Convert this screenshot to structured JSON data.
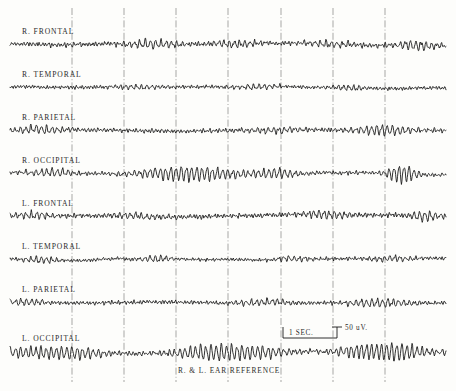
{
  "figure": {
    "caption": "R. & L. EAR REFERENCE",
    "background_color": "#fdfdfb",
    "trace_color": "#1a1a1a",
    "grid_color": "#5a5a5a"
  },
  "calibration": {
    "time_label": "1 SEC.",
    "amplitude_label": "50 uV.",
    "time_seconds": 1,
    "amplitude_microvolts": 50,
    "bar_x_start_px": 283,
    "bar_x_end_px": 337,
    "bar_y_px": 338,
    "tick_height_px": 11
  },
  "chart_data": {
    "type": "line",
    "title": "",
    "subtitle": "",
    "xlabel": "1 SEC.",
    "ylabel": "50 uV.",
    "legend_position": "none",
    "grid": true,
    "grid_x_positions_px": [
      72,
      124,
      176,
      228,
      281,
      333,
      385
    ],
    "x_axis": {
      "units": "seconds",
      "plot_x_start_px": 10,
      "plot_x_end_px": 446,
      "seconds_per_division": 1
    },
    "y_axis": {
      "units": "microvolts",
      "calibration_microvolts": 50
    },
    "annotations": [
      "R. & L. EAR REFERENCE",
      "1 SEC.",
      "50 uV."
    ],
    "series": [
      {
        "name": "R. FRONTAL",
        "label": "R. FRONTAL",
        "baseline_y_px": 44,
        "label_y_px": 27,
        "band": "beta-mixed",
        "base_amplitude": 2.6,
        "base_frequency": 17.5,
        "seed": 11,
        "bursts": [
          {
            "center_fraction": 0.32,
            "width_fraction": 0.1,
            "amplitude": 3.0,
            "frequency": 10.2
          },
          {
            "center_fraction": 0.52,
            "width_fraction": 0.09,
            "amplitude": 3.4,
            "frequency": 10.6
          },
          {
            "center_fraction": 0.74,
            "width_fraction": 0.07,
            "amplitude": 3.2,
            "frequency": 10.0
          },
          {
            "center_fraction": 0.93,
            "width_fraction": 0.06,
            "amplitude": 3.6,
            "frequency": 10.4
          }
        ]
      },
      {
        "name": "R. TEMPORAL",
        "label": "R. TEMPORAL",
        "baseline_y_px": 87,
        "label_y_px": 70,
        "band": "low-voltage-fast",
        "base_amplitude": 1.9,
        "base_frequency": 18.5,
        "seed": 23,
        "bursts": [
          {
            "center_fraction": 0.3,
            "width_fraction": 0.08,
            "amplitude": 2.0,
            "frequency": 10.5
          },
          {
            "center_fraction": 0.56,
            "width_fraction": 0.07,
            "amplitude": 2.2,
            "frequency": 10.2
          },
          {
            "center_fraction": 0.78,
            "width_fraction": 0.06,
            "amplitude": 2.4,
            "frequency": 10.6
          }
        ]
      },
      {
        "name": "R. PARIETAL",
        "label": "R. PARIETAL",
        "baseline_y_px": 130,
        "label_y_px": 113,
        "band": "alpha-mixed",
        "base_amplitude": 2.3,
        "base_frequency": 17.0,
        "seed": 37,
        "bursts": [
          {
            "center_fraction": 0.07,
            "width_fraction": 0.08,
            "amplitude": 3.0,
            "frequency": 10.4
          },
          {
            "center_fraction": 0.62,
            "width_fraction": 0.1,
            "amplitude": 2.6,
            "frequency": 10.2
          },
          {
            "center_fraction": 0.86,
            "width_fraction": 0.09,
            "amplitude": 4.2,
            "frequency": 10.5
          }
        ]
      },
      {
        "name": "R. OCCIPITAL",
        "label": "R. OCCIPITAL",
        "baseline_y_px": 173,
        "label_y_px": 156,
        "band": "alpha-dominant",
        "base_amplitude": 2.1,
        "base_frequency": 16.5,
        "seed": 53,
        "bursts": [
          {
            "center_fraction": 0.1,
            "width_fraction": 0.07,
            "amplitude": 3.2,
            "frequency": 10.3
          },
          {
            "center_fraction": 0.42,
            "width_fraction": 0.16,
            "amplitude": 6.8,
            "frequency": 10.5
          },
          {
            "center_fraction": 0.61,
            "width_fraction": 0.07,
            "amplitude": 3.6,
            "frequency": 10.2
          },
          {
            "center_fraction": 0.9,
            "width_fraction": 0.05,
            "amplitude": 7.5,
            "frequency": 11.0
          }
        ]
      },
      {
        "name": "L. FRONTAL",
        "label": "L. FRONTAL",
        "baseline_y_px": 216,
        "label_y_px": 199,
        "band": "beta-mixed",
        "base_amplitude": 2.5,
        "base_frequency": 17.8,
        "seed": 71,
        "bursts": [
          {
            "center_fraction": 0.05,
            "width_fraction": 0.07,
            "amplitude": 3.4,
            "frequency": 10.4
          },
          {
            "center_fraction": 0.3,
            "width_fraction": 0.08,
            "amplitude": 2.8,
            "frequency": 10.1
          },
          {
            "center_fraction": 0.72,
            "width_fraction": 0.08,
            "amplitude": 3.0,
            "frequency": 10.6
          },
          {
            "center_fraction": 0.95,
            "width_fraction": 0.05,
            "amplitude": 3.8,
            "frequency": 10.3
          }
        ]
      },
      {
        "name": "L. TEMPORAL",
        "label": "L. TEMPORAL",
        "baseline_y_px": 259,
        "label_y_px": 242,
        "band": "low-voltage-fast",
        "base_amplitude": 1.8,
        "base_frequency": 18.8,
        "seed": 89,
        "bursts": [
          {
            "center_fraction": 0.07,
            "width_fraction": 0.07,
            "amplitude": 2.4,
            "frequency": 10.5
          },
          {
            "center_fraction": 0.34,
            "width_fraction": 0.07,
            "amplitude": 2.2,
            "frequency": 10.2
          },
          {
            "center_fraction": 0.66,
            "width_fraction": 0.06,
            "amplitude": 2.0,
            "frequency": 10.4
          },
          {
            "center_fraction": 0.88,
            "width_fraction": 0.07,
            "amplitude": 2.6,
            "frequency": 10.7
          }
        ]
      },
      {
        "name": "L. PARIETAL",
        "label": "L. PARIETAL",
        "baseline_y_px": 302,
        "label_y_px": 285,
        "band": "alpha-mixed",
        "base_amplitude": 2.2,
        "base_frequency": 17.2,
        "seed": 101,
        "bursts": [
          {
            "center_fraction": 0.04,
            "width_fraction": 0.07,
            "amplitude": 3.0,
            "frequency": 10.3
          },
          {
            "center_fraction": 0.58,
            "width_fraction": 0.11,
            "amplitude": 2.8,
            "frequency": 10.5
          },
          {
            "center_fraction": 0.84,
            "width_fraction": 0.1,
            "amplitude": 3.4,
            "frequency": 10.2
          }
        ]
      },
      {
        "name": "L. OCCIPITAL",
        "label": "L. OCCIPITAL",
        "baseline_y_px": 352,
        "label_y_px": 334,
        "band": "alpha-dominant",
        "base_amplitude": 2.4,
        "base_frequency": 16.0,
        "seed": 127,
        "bursts": [
          {
            "center_fraction": 0.06,
            "width_fraction": 0.12,
            "amplitude": 5.4,
            "frequency": 10.6
          },
          {
            "center_fraction": 0.18,
            "width_fraction": 0.09,
            "amplitude": 3.6,
            "frequency": 10.3
          },
          {
            "center_fraction": 0.5,
            "width_fraction": 0.17,
            "amplitude": 7.4,
            "frequency": 10.5
          },
          {
            "center_fraction": 0.86,
            "width_fraction": 0.14,
            "amplitude": 8.0,
            "frequency": 10.8
          }
        ]
      }
    ]
  }
}
